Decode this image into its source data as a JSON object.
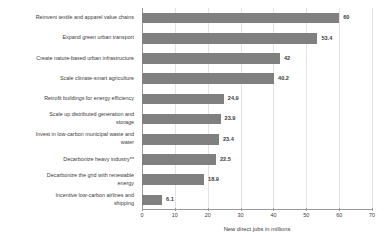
{
  "chart_data": {
    "type": "bar",
    "orientation": "horizontal",
    "title": "",
    "subtitle": "",
    "xlabel": "New direct jobs in millions",
    "ylabel": "",
    "xlim": [
      0,
      70
    ],
    "xticks": [
      0,
      10,
      20,
      30,
      40,
      50,
      60,
      70
    ],
    "xtick_labels": [
      "0",
      "10",
      "20",
      "30",
      "40",
      "50",
      "60",
      "70"
    ],
    "grid": "vertical",
    "legend": "none",
    "categories": [
      "Reinvent textile and apparel value chains",
      "Expand green urban transport",
      "Create nature-based urban infrastructure",
      "Scale climate-smart agriculture",
      "Retrofit buildings for energy efficiency",
      "Scale up distributed generation and\nstorage",
      "Invest in low-carbon municipal waste and\nwater",
      "Decarbonize heavy industry**",
      "Decarbonize the grid with renewable\nenergy",
      "Incentive low-carbon airlines and\nshipping"
    ],
    "values": [
      60,
      53.4,
      42,
      40.2,
      24.9,
      23.9,
      23.4,
      22.5,
      18.9,
      6.1
    ],
    "value_labels": [
      "60",
      "53.4",
      "42",
      "40.2",
      "24.9",
      "23.9",
      "23.4",
      "22.5",
      "18.9",
      "6.1"
    ],
    "series": [
      {
        "name": "New direct jobs in millions",
        "values": [
          60,
          53.4,
          42,
          40.2,
          24.9,
          23.9,
          23.4,
          22.5,
          18.9,
          6.1
        ]
      }
    ],
    "colors": {
      "bar": "#808080",
      "grid": "#e3e3e3",
      "axis": "#9a9a9a",
      "text": "#3b3b3b",
      "background": "#ffffff"
    }
  }
}
